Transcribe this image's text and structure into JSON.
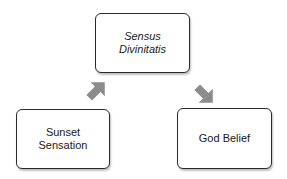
{
  "diagram": {
    "nodes": [
      {
        "id": "sensus",
        "label": "Sensus\nDivinitatis",
        "style": "italic"
      },
      {
        "id": "sunset",
        "label": "Sunset\nSensation",
        "style": "normal"
      },
      {
        "id": "belief",
        "label": "God Belief",
        "style": "normal"
      }
    ],
    "edges": [
      {
        "from": "sunset",
        "to": "sensus",
        "icon": "arrow-up-right-icon"
      },
      {
        "from": "sensus",
        "to": "belief",
        "icon": "arrow-down-right-icon"
      }
    ],
    "colors": {
      "border": "#2a2a2a",
      "arrow": "#8c8c8c",
      "background": "#ffffff"
    }
  }
}
